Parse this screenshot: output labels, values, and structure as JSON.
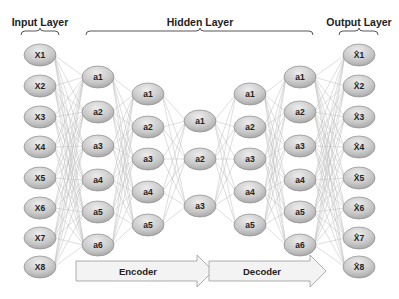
{
  "titles": {
    "input": "Input Layer",
    "hidden": "Hidden Layer",
    "output": "Output Layer"
  },
  "arrows": {
    "encoder": "Encoder",
    "decoder": "Decoder"
  },
  "colors": {
    "node_fill_light": "#e6e6e6",
    "node_fill_dark": "#a9a9a9",
    "node_stroke": "#8c8c8c",
    "edge": "#bdbdbd",
    "arrow_fill": "#f3f3f3",
    "arrow_stroke": "#999999"
  },
  "layers": [
    {
      "name": "input",
      "x": 40,
      "nodes": [
        {
          "label": "X1",
          "y": 55
        },
        {
          "label": "X2",
          "y": 86
        },
        {
          "label": "X3",
          "y": 117
        },
        {
          "label": "X4",
          "y": 147
        },
        {
          "label": "X5",
          "y": 178
        },
        {
          "label": "X6",
          "y": 208
        },
        {
          "label": "X7",
          "y": 238
        },
        {
          "label": "X8",
          "y": 267
        }
      ]
    },
    {
      "name": "hidden-1",
      "x": 98,
      "nodes": [
        {
          "label": "a1",
          "y": 77
        },
        {
          "label": "a2",
          "y": 112
        },
        {
          "label": "a3",
          "y": 146
        },
        {
          "label": "a4",
          "y": 180
        },
        {
          "label": "a5",
          "y": 212
        },
        {
          "label": "a6",
          "y": 245
        }
      ]
    },
    {
      "name": "hidden-2",
      "x": 148,
      "nodes": [
        {
          "label": "a1",
          "y": 94
        },
        {
          "label": "a2",
          "y": 127
        },
        {
          "label": "a3",
          "y": 159
        },
        {
          "label": "a4",
          "y": 192
        },
        {
          "label": "a5",
          "y": 225
        }
      ]
    },
    {
      "name": "bottleneck",
      "x": 200,
      "nodes": [
        {
          "label": "a1",
          "y": 121
        },
        {
          "label": "a2",
          "y": 159
        },
        {
          "label": "a3",
          "y": 206
        }
      ]
    },
    {
      "name": "hidden-4",
      "x": 250,
      "nodes": [
        {
          "label": "a1",
          "y": 94
        },
        {
          "label": "a2",
          "y": 127
        },
        {
          "label": "a3",
          "y": 159
        },
        {
          "label": "a4",
          "y": 192
        },
        {
          "label": "a5",
          "y": 225
        }
      ]
    },
    {
      "name": "hidden-5",
      "x": 300,
      "nodes": [
        {
          "label": "a1",
          "y": 77
        },
        {
          "label": "a2",
          "y": 112
        },
        {
          "label": "a3",
          "y": 146
        },
        {
          "label": "a4",
          "y": 180
        },
        {
          "label": "a5",
          "y": 212
        },
        {
          "label": "a6",
          "y": 245
        }
      ]
    },
    {
      "name": "output",
      "x": 359,
      "nodes": [
        {
          "label": "X̂1",
          "y": 55
        },
        {
          "label": "X̂2",
          "y": 86
        },
        {
          "label": "X̂3",
          "y": 117
        },
        {
          "label": "X̂4",
          "y": 147
        },
        {
          "label": "X̂5",
          "y": 178
        },
        {
          "label": "X̂6",
          "y": 208
        },
        {
          "label": "X̂7",
          "y": 238
        },
        {
          "label": "X̂8",
          "y": 267
        }
      ]
    }
  ]
}
